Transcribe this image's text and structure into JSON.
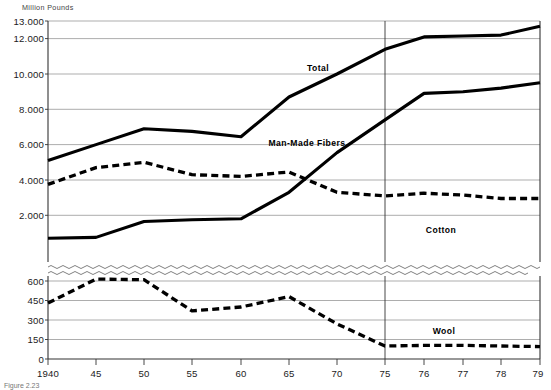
{
  "figure": {
    "unit_label": "Million Pounds",
    "source_note": "Figure 2.23"
  },
  "axes": {
    "y_upper_ticks": [
      "13.000",
      "12.000",
      "10.000",
      "8.000",
      "6.000",
      "4.000",
      "2.000"
    ],
    "y_lower_ticks": [
      "600",
      "450",
      "300",
      "150",
      "0"
    ],
    "x_ticks": [
      "1940",
      "45",
      "50",
      "55",
      "60",
      "65",
      "70",
      "75",
      "76",
      "77",
      "78",
      "79"
    ],
    "break_marker": "wavy-axis-break"
  },
  "series_labels": {
    "total": "Total",
    "man_made_fibers": "Man-Made Fibers",
    "cotton": "Cotton",
    "wool": "Wool"
  },
  "chart_data": {
    "type": "line",
    "title": "",
    "subtitle": "",
    "xlabel": "",
    "ylabel": "Million Pounds",
    "grid": true,
    "legend_position": "inline-annotations",
    "axis_note": "Y axis is broken: upper panel 2.000-13.000 (Total, Man-Made Fibers, Cotton); lower panel 0-600 (Wool). X axis scale changes after 1975 (5-year steps to 1975, then yearly 76-79).",
    "x": [
      1940,
      1945,
      1950,
      1955,
      1960,
      1965,
      1970,
      1975,
      1976,
      1977,
      1978,
      1979
    ],
    "x_tick_labels": [
      "1940",
      "45",
      "50",
      "55",
      "60",
      "65",
      "70",
      "75",
      "76",
      "77",
      "78",
      "79"
    ],
    "ylim_upper": [
      2000,
      13000
    ],
    "ylim_lower": [
      0,
      600
    ],
    "series": [
      {
        "name": "Total",
        "style": "solid",
        "panel": "upper",
        "values": [
          5100,
          6000,
          6900,
          6750,
          6450,
          8700,
          10000,
          11400,
          12100,
          12150,
          12200,
          12700
        ]
      },
      {
        "name": "Man-Made Fibers",
        "style": "solid",
        "panel": "upper",
        "values": [
          700,
          750,
          1650,
          1750,
          1800,
          3300,
          5550,
          7400,
          8900,
          9000,
          9200,
          9500
        ]
      },
      {
        "name": "Cotton",
        "style": "dashed",
        "panel": "upper",
        "values": [
          3750,
          4700,
          5000,
          4300,
          4200,
          4450,
          3300,
          3100,
          3250,
          3150,
          2950,
          2950
        ]
      },
      {
        "name": "Wool",
        "style": "dashed",
        "panel": "lower",
        "values": [
          430,
          615,
          610,
          370,
          400,
          480,
          270,
          100,
          105,
          105,
          100,
          95
        ]
      }
    ]
  }
}
